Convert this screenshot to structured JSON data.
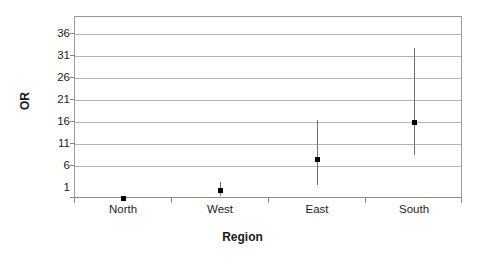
{
  "chart_data": {
    "type": "scatter",
    "title": "",
    "xlabel": "Region",
    "ylabel": "OR",
    "categories": [
      "North",
      "West",
      "East",
      "South"
    ],
    "values": [
      1.0,
      2.8,
      9.9,
      18.3
    ],
    "error_low": [
      1.0,
      1.4,
      4.0,
      10.8
    ],
    "error_high": [
      1.0,
      4.6,
      18.7,
      35.1
    ],
    "ylim": [
      1,
      38.5
    ],
    "yticks": [
      1,
      6,
      11,
      16,
      21,
      26,
      31,
      36
    ],
    "ytick_labels": [
      "1",
      "6",
      "11",
      "16",
      "21",
      "26",
      "31",
      "36"
    ],
    "grid": true,
    "legend": null,
    "series": [
      {
        "name": "OR with 95% CI",
        "points": [
          {
            "category": "North",
            "value": 1.0,
            "low": 1.0,
            "high": 1.0
          },
          {
            "category": "West",
            "value": 2.8,
            "low": 1.4,
            "high": 4.6
          },
          {
            "category": "East",
            "value": 9.9,
            "low": 4.0,
            "high": 18.7
          },
          {
            "category": "South",
            "value": 18.3,
            "low": 10.8,
            "high": 35.1
          }
        ]
      }
    ]
  },
  "axes": {
    "y_title": "OR",
    "x_title": "Region",
    "y_tick_labels": [
      "36",
      "31",
      "26",
      "21",
      "16",
      "11",
      "6",
      "1"
    ],
    "x_tick_labels": [
      "North",
      "West",
      "East",
      "South"
    ]
  },
  "colors": {
    "marker": "#000000",
    "error_bar": "#6f6f6f",
    "gridline": "#b5b5b5",
    "frame": "#9a9a9a",
    "text": "#1d1d1d",
    "background": "#ffffff"
  }
}
